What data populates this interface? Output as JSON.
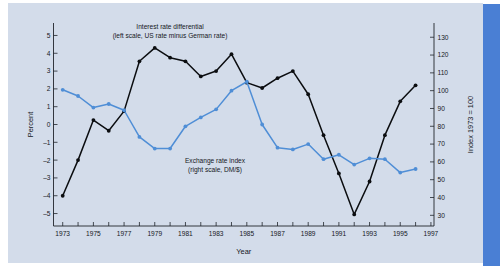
{
  "figure": {
    "background_color": "#d3dcea",
    "accent_band_color": "#4a7fd4",
    "black_series_color": "#0b0d10",
    "blue_series_color": "#4f8ed6"
  },
  "chart_data": {
    "type": "line",
    "title": "",
    "xlabel": "Year",
    "ylabel": "Percent",
    "y2label": "Index 1973 = 100",
    "grid": false,
    "legend_position": "inline-annotations",
    "x": [
      1973,
      1974,
      1975,
      1976,
      1977,
      1978,
      1979,
      1980,
      1981,
      1982,
      1983,
      1984,
      1985,
      1986,
      1987,
      1988,
      1989,
      1990,
      1991,
      1992,
      1993,
      1994,
      1995,
      1996
    ],
    "xlim": [
      1972.4,
      1997.2
    ],
    "xticks": [
      1973,
      1974,
      1975,
      1976,
      1977,
      1978,
      1979,
      1980,
      1981,
      1982,
      1983,
      1984,
      1985,
      1986,
      1987,
      1988,
      1989,
      1990,
      1991,
      1992,
      1993,
      1994,
      1995,
      1996,
      1997
    ],
    "xticklabels": [
      "1973",
      "",
      "1975",
      "",
      "1977",
      "",
      "1979",
      "",
      "1981",
      "",
      "1983",
      "",
      "1985",
      "",
      "1987",
      "",
      "1989",
      "",
      "1991",
      "",
      "1993",
      "",
      "1995",
      "",
      "1997"
    ],
    "ylim": [
      -5.7,
      5.7
    ],
    "yticks": [
      -5,
      -4,
      -3,
      -2,
      -1,
      0,
      1,
      2,
      3,
      4,
      5
    ],
    "yticklabels": [
      "–5",
      "–4",
      "–3",
      "–2",
      "–1",
      "0",
      "1",
      "2",
      "3",
      "4",
      "5"
    ],
    "y2lim": [
      24,
      138
    ],
    "y2ticks": [
      30,
      40,
      50,
      60,
      70,
      80,
      90,
      100,
      110,
      120,
      130
    ],
    "y2ticklabels": [
      "30",
      "40",
      "50",
      "60",
      "70",
      "80",
      "90",
      "100",
      "110",
      "120",
      "130"
    ],
    "series": [
      {
        "name": "Interest rate differential",
        "axis": "left",
        "units": "percent",
        "color": "#0b0d10",
        "marker": "circle",
        "values": [
          -4.0,
          -2.0,
          0.25,
          -0.35,
          0.75,
          3.55,
          4.3,
          3.75,
          3.55,
          2.7,
          3.0,
          3.95,
          2.35,
          2.05,
          2.6,
          3.0,
          1.7,
          -0.6,
          -2.75,
          -5.05,
          -3.2,
          -0.6,
          1.3,
          2.2
        ]
      },
      {
        "name": "Exchange rate index",
        "axis": "right",
        "units": "index 1973 = 100",
        "color": "#4f8ed6",
        "marker": "circle",
        "values_left_scale": [
          2.05,
          1.7,
          1.0,
          1.2,
          0.75,
          -0.8,
          -1.45,
          -1.45,
          0.5,
          1.0,
          1.45,
          2.55,
          3.0,
          0.1,
          -1.25,
          -1.35,
          -1.05,
          -1.9,
          -1.6,
          -2.2,
          -1.8,
          -1.85,
          -2.65,
          -2.45
        ],
        "values": [
          100.5,
          97.0,
          90.5,
          92.5,
          89.0,
          74.0,
          67.5,
          67.5,
          80.0,
          85.0,
          89.5,
          100.0,
          105.0,
          81.0,
          68.0,
          67.0,
          70.0,
          61.5,
          64.0,
          58.5,
          62.0,
          61.5,
          54.0,
          56.0
        ]
      }
    ],
    "annotations": [
      {
        "name": "interest-rate-differential-label",
        "line1": "Interest rate differential",
        "line2": "(left scale, US rate minus German rate)"
      },
      {
        "name": "exchange-rate-index-label",
        "line1": "Exchange rate index",
        "line2": "(right scale, DM/$)"
      }
    ]
  }
}
